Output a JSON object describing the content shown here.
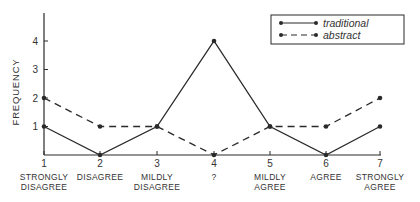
{
  "chart_data": {
    "type": "line",
    "title": "",
    "xlabel": "",
    "ylabel": "FREQUENCY",
    "ylim": [
      0,
      4.9
    ],
    "grid": false,
    "legend_position": "top-right",
    "x": [
      1,
      2,
      3,
      4,
      5,
      6,
      7
    ],
    "categories": [
      "STRONGLY DISAGREE",
      "DISAGREE",
      "MILDLY DISAGREE",
      "?",
      "MILDLY AGREE",
      "AGREE",
      "STRONGLY AGREE"
    ],
    "category_lines": [
      [
        "STRONGLY",
        "DISAGREE"
      ],
      [
        "DISAGREE"
      ],
      [
        "MILDLY",
        "DISAGREE"
      ],
      [
        "?"
      ],
      [
        "MILDLY",
        "AGREE"
      ],
      [
        "AGREE"
      ],
      [
        "STRONGLY",
        "AGREE"
      ]
    ],
    "yticks": [
      1,
      2,
      3,
      4
    ],
    "series": [
      {
        "name": "traditional",
        "style": "solid",
        "values": [
          1,
          0,
          1,
          4,
          1,
          0,
          1
        ]
      },
      {
        "name": "abstract",
        "style": "dashed",
        "values": [
          2,
          1,
          1,
          0,
          1,
          1,
          2
        ]
      }
    ]
  },
  "colors": {
    "ink": "#2a2a2a",
    "background": "#ffffff"
  }
}
